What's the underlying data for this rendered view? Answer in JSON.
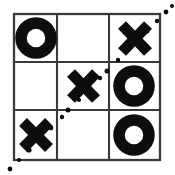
{
  "board": {
    "title": "Tic-Tac-Toe Board",
    "rows": 3,
    "cols": 3,
    "cells": [
      {
        "id": "cell-0-0",
        "row": 0,
        "col": 0,
        "mark": "O",
        "label": "O"
      },
      {
        "id": "cell-0-1",
        "row": 0,
        "col": 1,
        "mark": "",
        "label": ""
      },
      {
        "id": "cell-0-2",
        "row": 0,
        "col": 2,
        "mark": "X",
        "label": "X"
      },
      {
        "id": "cell-1-0",
        "row": 1,
        "col": 0,
        "mark": "",
        "label": ""
      },
      {
        "id": "cell-1-1",
        "row": 1,
        "col": 1,
        "mark": "X",
        "label": "X"
      },
      {
        "id": "cell-1-2",
        "row": 1,
        "col": 2,
        "mark": "O",
        "label": "O"
      },
      {
        "id": "cell-2-0",
        "row": 2,
        "col": 0,
        "mark": "X",
        "label": "X"
      },
      {
        "id": "cell-2-1",
        "row": 2,
        "col": 1,
        "mark": "",
        "label": ""
      },
      {
        "id": "cell-2-2",
        "row": 2,
        "col": 2,
        "mark": "O",
        "label": "O"
      }
    ],
    "winner": "X",
    "win_line": {
      "name": "anti-diagonal",
      "from_cell": "cell-2-0",
      "through_cell": "cell-1-1",
      "to_cell": "cell-0-2",
      "style": "dotted"
    },
    "colors": {
      "mark": "#0d0d0d",
      "grid": "#3a3a3a",
      "background": "#ffffff",
      "win_line": "#0d0d0d"
    }
  }
}
